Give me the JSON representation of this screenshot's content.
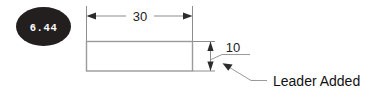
{
  "canvas": {
    "width": 373,
    "height": 98,
    "background": "#ffffff"
  },
  "badge": {
    "name": "step-number-badge",
    "label": "6.44",
    "fill_color": "#231f1f",
    "text_color": "#ffffff",
    "shape": "ellipse"
  },
  "drawing": {
    "title": "",
    "part_shape": "rectangle",
    "line_color": "#9a9a9a",
    "dimension_color": "#8d8d8d",
    "arrow_color": "#2b2b2b",
    "dimensions": [
      {
        "name": "horizontal-dimension",
        "value": "30",
        "orientation": "horizontal",
        "placement": "above",
        "arrow_style": "outward"
      },
      {
        "name": "vertical-dimension",
        "value": "10",
        "orientation": "vertical",
        "placement": "right",
        "arrow_style": "inward"
      }
    ],
    "annotations": [
      {
        "name": "leader-note",
        "text": "Leader Added",
        "has_arrowhead": true,
        "arrow_direction": "up-left"
      }
    ]
  },
  "icons": {
    "arrow_left": "arrow-left-icon",
    "arrow_right": "arrow-right-icon",
    "arrow_up": "arrow-up-icon",
    "arrow_down": "arrow-down-icon",
    "leader_arrow": "leader-arrow-icon"
  }
}
